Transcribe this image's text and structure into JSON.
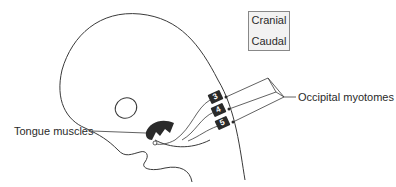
{
  "diagram": {
    "orientation_box": {
      "top_label": "Cranial",
      "bottom_label": "Caudal"
    },
    "labels": {
      "occipital": "Occipital myotomes",
      "tongue": "Tongue muscles"
    },
    "segments": [
      {
        "number": "3"
      },
      {
        "number": "4"
      },
      {
        "number": "5"
      }
    ],
    "colors": {
      "line": "#3a3a3a",
      "fill_dark": "#2a2a2a",
      "box_bg": "#f2f2f2"
    }
  }
}
